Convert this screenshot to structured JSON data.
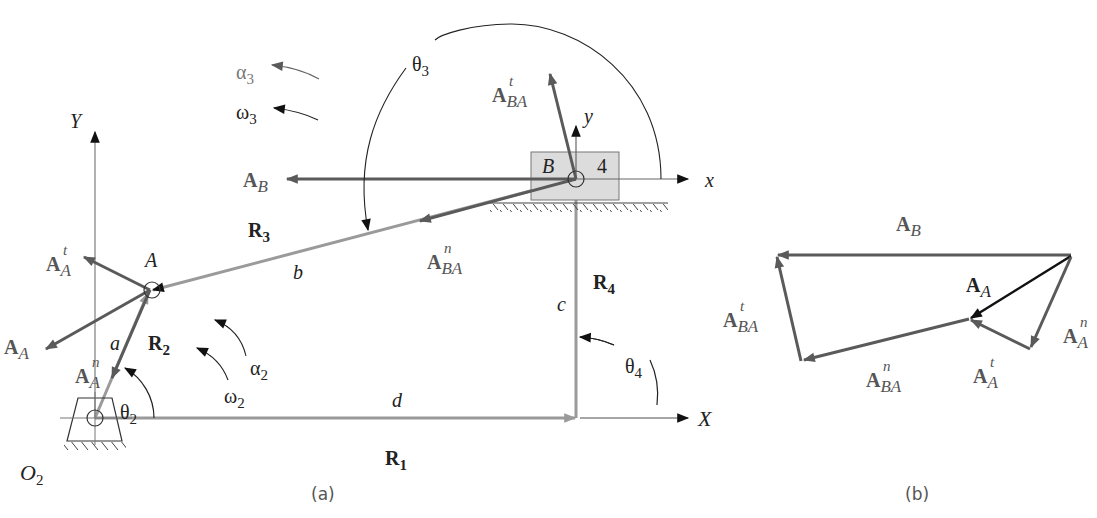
{
  "figure": {
    "panel_a": {
      "caption": "(a)",
      "axes": {
        "global_x": "X",
        "global_y": "Y",
        "local_x": "x",
        "local_y": "y"
      },
      "points": {
        "A": "A",
        "B": "B",
        "O2": "O",
        "O2_sub": "2",
        "block_number": "4"
      },
      "links": {
        "a": "a",
        "b": "b",
        "c": "c",
        "d": "d"
      },
      "position_vectors": {
        "R1": {
          "main": "R",
          "sub": "1"
        },
        "R2": {
          "main": "R",
          "sub": "2"
        },
        "R3": {
          "main": "R",
          "sub": "3"
        },
        "R4": {
          "main": "R",
          "sub": "4"
        }
      },
      "angles": {
        "theta2": {
          "sym": "θ",
          "sub": "2"
        },
        "theta3": {
          "sym": "θ",
          "sub": "3"
        },
        "theta4": {
          "sym": "θ",
          "sub": "4"
        }
      },
      "angular": {
        "alpha2": {
          "sym": "α",
          "sub": "2"
        },
        "omega2": {
          "sym": "ω",
          "sub": "2"
        },
        "alpha3": {
          "sym": "α",
          "sub": "3"
        },
        "omega3": {
          "sym": "ω",
          "sub": "3"
        }
      },
      "accelerations": {
        "AB": {
          "main": "A",
          "sub": "B",
          "sup": ""
        },
        "AA": {
          "main": "A",
          "sub": "A",
          "sup": ""
        },
        "AAt": {
          "main": "A",
          "sub": "A",
          "sup": "t"
        },
        "AAn": {
          "main": "A",
          "sub": "A",
          "sup": "n"
        },
        "ABAt": {
          "main": "A",
          "sub": "BA",
          "sup": "t"
        },
        "ABAn": {
          "main": "A",
          "sub": "BA",
          "sup": "n"
        }
      }
    },
    "panel_b": {
      "caption": "(b)",
      "accelerations": {
        "AB": {
          "main": "A",
          "sub": "B",
          "sup": ""
        },
        "AA": {
          "main": "A",
          "sub": "A",
          "sup": ""
        },
        "AAt": {
          "main": "A",
          "sub": "A",
          "sup": "t"
        },
        "AAn": {
          "main": "A",
          "sub": "A",
          "sup": "n"
        },
        "ABAt": {
          "main": "A",
          "sub": "BA",
          "sup": "t"
        },
        "ABAn": {
          "main": "A",
          "sub": "BA",
          "sup": "n"
        }
      }
    },
    "colors": {
      "link": "#9a9a9a",
      "vector": "#5a5a5a",
      "dark": "#111111",
      "block_fill": "#dcdcdc",
      "label": "#555555"
    }
  }
}
